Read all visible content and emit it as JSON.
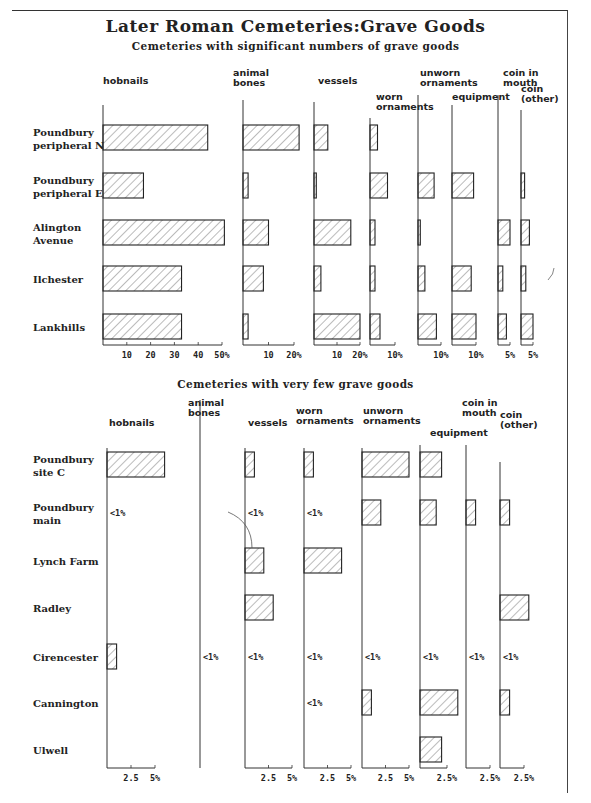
{
  "title": "Later Roman Cemeteries:Grave Goods",
  "chart_data": [
    {
      "type": "bar",
      "orientation": "horizontal",
      "title": "Cemeteries with significant numbers of grave goods",
      "categories": [
        "Poundbury peripheral N",
        "Poundbury peripheral E",
        "Alington Avenue",
        "Ilchester",
        "Lankhills"
      ],
      "series": [
        {
          "name": "hobnails",
          "unit": "%",
          "ticks": [
            "10",
            "20",
            "30",
            "40",
            "50%"
          ],
          "max": 50,
          "values": [
            44,
            17,
            51,
            33,
            33
          ]
        },
        {
          "name": "animal bones",
          "unit": "%",
          "ticks": [
            "10",
            "20%"
          ],
          "max": 20,
          "values": [
            22,
            2,
            10,
            8,
            2
          ]
        },
        {
          "name": "vessels",
          "unit": "%",
          "ticks": [
            "10",
            "20%"
          ],
          "max": 20,
          "values": [
            6,
            1,
            16,
            3,
            20
          ]
        },
        {
          "name": "worn ornaments",
          "unit": "%",
          "ticks": [
            "10%"
          ],
          "max": 10,
          "values": [
            3,
            7,
            2,
            2,
            4
          ]
        },
        {
          "name": "unworn ornaments",
          "unit": "%",
          "ticks": [
            "10%"
          ],
          "max": 10,
          "values": [
            0,
            7,
            1,
            3,
            8
          ]
        },
        {
          "name": "equipment",
          "unit": "%",
          "ticks": [
            "10%"
          ],
          "max": 10,
          "values": [
            0,
            9,
            0,
            8,
            10
          ]
        },
        {
          "name": "coin in mouth",
          "unit": "%",
          "ticks": [
            "5%"
          ],
          "max": 5,
          "values": [
            0,
            0,
            5,
            2,
            3.5
          ]
        },
        {
          "name": "coin (other)",
          "unit": "%",
          "ticks": [
            "5%"
          ],
          "max": 5,
          "values": [
            0,
            1.5,
            3.5,
            2,
            5
          ]
        }
      ]
    },
    {
      "type": "bar",
      "orientation": "horizontal",
      "title": "Cemeteries with very few grave goods",
      "categories": [
        "Poundbury site C",
        "Poundbury main",
        "Lynch Farm",
        "Radley",
        "Cirencester",
        "Cannington",
        "Ulwell"
      ],
      "series": [
        {
          "name": "hobnails",
          "unit": "%",
          "ticks": [
            "2.5",
            "5%"
          ],
          "max": 5,
          "values": [
            6,
            "<1%",
            0,
            0,
            1,
            0,
            0
          ]
        },
        {
          "name": "animal bones",
          "unit": "%",
          "ticks": [],
          "max": 5,
          "values": [
            0,
            0,
            0,
            0,
            "<1%",
            0,
            0
          ]
        },
        {
          "name": "vessels",
          "unit": "%",
          "ticks": [
            "2.5",
            "5%"
          ],
          "max": 5,
          "values": [
            1,
            "<1%",
            2,
            3,
            "<1%",
            0,
            0
          ]
        },
        {
          "name": "worn ornaments",
          "unit": "%",
          "ticks": [
            "2.5",
            "5%"
          ],
          "max": 5,
          "values": [
            1,
            "<1%",
            4,
            0,
            "<1%",
            "<1%",
            0
          ]
        },
        {
          "name": "unworn ornaments",
          "unit": "%",
          "ticks": [
            "2.5",
            "5%"
          ],
          "max": 5,
          "values": [
            5,
            2,
            0,
            0,
            "<1%",
            1,
            0
          ]
        },
        {
          "name": "equipment",
          "unit": "%",
          "ticks": [
            "2.5%"
          ],
          "max": 2.5,
          "values": [
            2,
            1.5,
            0,
            0,
            "<1%",
            3.5,
            2
          ]
        },
        {
          "name": "coin in mouth",
          "unit": "%",
          "ticks": [
            "2.5%"
          ],
          "max": 2.5,
          "values": [
            0,
            1,
            0,
            0,
            "<1%",
            0,
            0
          ]
        },
        {
          "name": "coin (other)",
          "unit": "%",
          "ticks": [
            "2.5%"
          ],
          "max": 2.5,
          "values": [
            0,
            1,
            0,
            3,
            "<1%",
            1,
            0
          ]
        }
      ]
    }
  ],
  "labels": {
    "top": {
      "subtitle": "Cemeteries with significant numbers of grave goods",
      "rows": [
        "Poundbury|peripheral N",
        "Poundbury|peripheral E",
        "Alington|Avenue",
        "Ilchester",
        "Lankhills"
      ],
      "cols": [
        "hobnails",
        "animal|bones",
        "vessels",
        "worn|ornaments",
        "unworn|ornaments",
        "equipment",
        "coin in|mouth",
        "coin|(other)"
      ]
    },
    "bottom": {
      "subtitle": "Cemeteries with very few grave goods",
      "rows": [
        "Poundbury|site C",
        "Poundbury|main",
        "Lynch Farm",
        "Radley",
        "Cirencester",
        "Cannington",
        "Ulwell"
      ],
      "cols": [
        "hobnails",
        "animal|bones",
        "vessels",
        "worn|ornaments",
        "unworn|ornaments",
        "equipment",
        "coin in|mouth",
        "coin|(other)"
      ]
    },
    "less_than_label": "<1%"
  }
}
